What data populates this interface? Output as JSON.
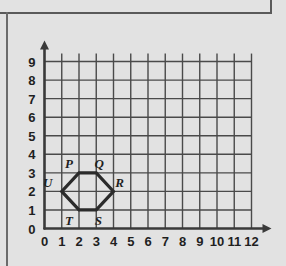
{
  "figure": {
    "title": "",
    "background_color": "#e2e2e2",
    "grid_color": "#4a4a4a",
    "axis_color": "#3a3a3a",
    "shape_color": "#2b2b2b"
  },
  "chart_data": {
    "type": "scatter",
    "title": "",
    "xlabel": "",
    "ylabel": "",
    "xlim": [
      0,
      12
    ],
    "ylim": [
      0,
      9
    ],
    "grid": true,
    "legend": "none",
    "x_ticks": [
      "0",
      "1",
      "2",
      "3",
      "4",
      "5",
      "6",
      "7",
      "8",
      "9",
      "10",
      "11",
      "12"
    ],
    "y_ticks": [
      "0",
      "1",
      "2",
      "3",
      "4",
      "5",
      "6",
      "7",
      "8",
      "9"
    ],
    "shapes": [
      {
        "name": "hexagon-PQRSTU",
        "closed": true,
        "vertices": [
          {
            "label": "P",
            "x": 2,
            "y": 3,
            "label_dx": -10,
            "label_dy": -5
          },
          {
            "label": "Q",
            "x": 3,
            "y": 3,
            "label_dx": 3,
            "label_dy": -5
          },
          {
            "label": "R",
            "x": 4,
            "y": 2,
            "label_dx": 6,
            "label_dy": -4
          },
          {
            "label": "S",
            "x": 3,
            "y": 1,
            "label_dx": 2,
            "label_dy": 15
          },
          {
            "label": "T",
            "x": 2,
            "y": 1,
            "label_dx": -10,
            "label_dy": 15
          },
          {
            "label": "U",
            "x": 1,
            "y": 2,
            "label_dx": -14,
            "label_dy": -4
          }
        ]
      }
    ]
  }
}
